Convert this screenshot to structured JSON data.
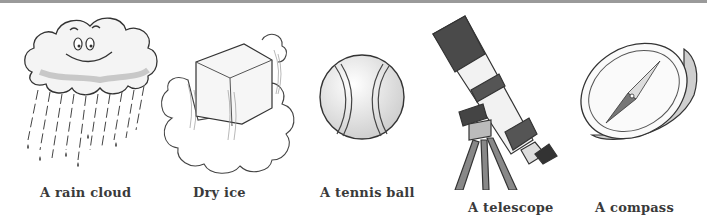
{
  "items": [
    {
      "name": "rain-cloud",
      "label": "A rain cloud"
    },
    {
      "name": "dry-ice",
      "label": "Dry ice"
    },
    {
      "name": "tennis-ball",
      "label": "A tennis ball"
    },
    {
      "name": "telescope",
      "label": "A telescope"
    },
    {
      "name": "compass",
      "label": "A compass"
    }
  ],
  "colors": {
    "top_rule": "#9a9a9a",
    "ink": "#3a3a3a",
    "shade": "#cfcfcf"
  }
}
